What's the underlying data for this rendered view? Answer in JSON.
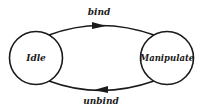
{
  "diagram": {
    "type": "state-transition",
    "states": [
      {
        "id": "idle",
        "label": "Idle"
      },
      {
        "id": "manipulate",
        "label": "Manipulate"
      }
    ],
    "transitions": [
      {
        "from": "idle",
        "to": "manipulate",
        "label": "bind"
      },
      {
        "from": "manipulate",
        "to": "idle",
        "label": "unbind"
      }
    ],
    "colors": {
      "stroke": "#1a1a1a",
      "background": "#ffffff"
    }
  }
}
